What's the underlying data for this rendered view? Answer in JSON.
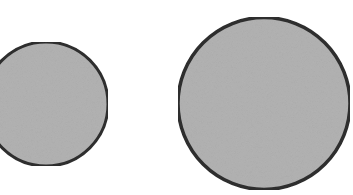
{
  "diagram": {
    "background": "#ffffff",
    "shapes": [
      {
        "id": "small-circle",
        "type": "circle",
        "cx": 46,
        "cy": 104,
        "r": 62,
        "fill": "#b3b3b3",
        "stroke": "#2e2e2e",
        "stroke_width": 3
      },
      {
        "id": "large-circle",
        "type": "circle",
        "cx": 264,
        "cy": 103.5,
        "r": 86,
        "fill": "#b3b3b3",
        "stroke": "#2e2e2e",
        "stroke_width": 3.5
      }
    ]
  }
}
